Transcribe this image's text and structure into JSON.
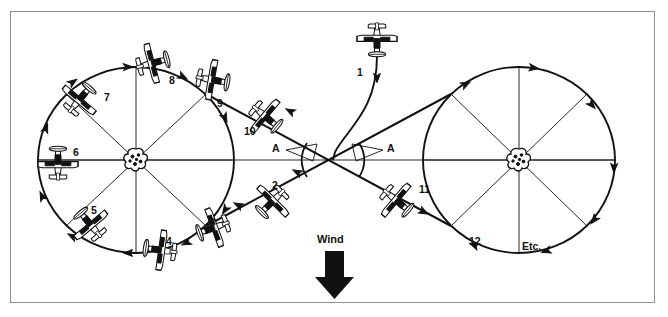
{
  "figure": {
    "frame_border_color": "#8f8f8f",
    "ink_color": "#111111",
    "background_color": "#ffffff"
  },
  "wind": {
    "label": "Wind",
    "direction": "down",
    "arrow_color": "#111111"
  },
  "angles": [
    {
      "id": "angle-left",
      "label": "A"
    },
    {
      "id": "angle-right",
      "label": "A"
    }
  ],
  "pylons": [
    {
      "id": "pylon-left",
      "name": "left-pylon-marker"
    },
    {
      "id": "pylon-right",
      "name": "right-pylon-marker"
    }
  ],
  "position_labels": [
    {
      "n": "1",
      "x": 357,
      "y": 72
    },
    {
      "n": "2",
      "x": 272,
      "y": 185
    },
    {
      "n": "3",
      "x": 210,
      "y": 222
    },
    {
      "n": "4",
      "x": 166,
      "y": 241
    },
    {
      "n": "5",
      "x": 91,
      "y": 210
    },
    {
      "n": "6",
      "x": 73,
      "y": 152
    },
    {
      "n": "7",
      "x": 104,
      "y": 97
    },
    {
      "n": "8",
      "x": 169,
      "y": 80
    },
    {
      "n": "9",
      "x": 217,
      "y": 103
    },
    {
      "n": "10",
      "x": 248,
      "y": 131
    },
    {
      "n": "11",
      "x": 419,
      "y": 189
    },
    {
      "n": "12",
      "x": 469,
      "y": 241
    }
  ],
  "etc_label": {
    "text": "Etc.",
    "x": 522,
    "y": 250
  },
  "planes": [
    {
      "id": "p1",
      "x": 377,
      "y": 40,
      "rot": 180
    },
    {
      "id": "p2",
      "x": 272,
      "y": 202,
      "rot": 225
    },
    {
      "id": "p3",
      "x": 213,
      "y": 228,
      "rot": 250
    },
    {
      "id": "p4",
      "x": 160,
      "y": 250,
      "rot": 278
    },
    {
      "id": "p5",
      "x": 90,
      "y": 224,
      "rot": 320
    },
    {
      "id": "p6",
      "x": 58,
      "y": 163,
      "rot": 0
    },
    {
      "id": "p7",
      "x": 80,
      "y": 99,
      "rot": 40
    },
    {
      "id": "p8",
      "x": 153,
      "y": 63,
      "rot": 75
    },
    {
      "id": "p9",
      "x": 213,
      "y": 80,
      "rot": 100
    },
    {
      "id": "p10",
      "x": 266,
      "y": 117,
      "rot": 130
    },
    {
      "id": "p11",
      "x": 397,
      "y": 201,
      "rot": 130
    }
  ],
  "geometry": {
    "left_circle": {
      "cx": 136,
      "cy": 160,
      "rx": 98,
      "ry": 93
    },
    "right_circle": {
      "cx": 519,
      "cy": 160,
      "rx": 96,
      "ry": 93
    },
    "crossover": {
      "x": 333,
      "y": 160
    },
    "horizontal_axis_y": 160
  }
}
